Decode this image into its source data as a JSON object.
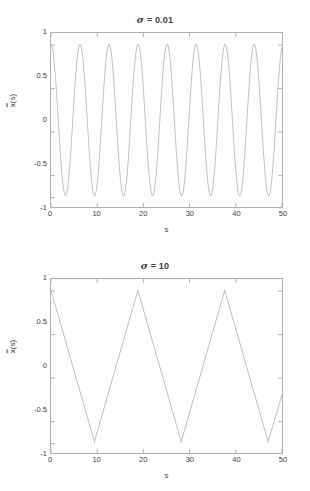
{
  "figure": {
    "background_color": "#ffffff",
    "axis_color": "#a8b0b8",
    "line_color": "#b8c2cc",
    "text_color": "#3d3d3d"
  },
  "chart_data": [
    {
      "type": "line",
      "title": "σ = 0.01",
      "title_symbol": "σ",
      "title_value": "= 0.01",
      "xlabel": "s",
      "ylabel": "x̄(s)",
      "ylabel_base": "x",
      "ylabel_suffix": "(s)",
      "xlim": [
        0,
        50
      ],
      "ylim": [
        -1.15,
        1.15
      ],
      "xticks": [
        0,
        10,
        20,
        30,
        40,
        50
      ],
      "xticklabels": [
        "0",
        "10",
        "20",
        "30",
        "40",
        "50"
      ],
      "yticks": [
        1,
        0.5,
        0,
        -0.5,
        -1
      ],
      "yticklabels": [
        "1",
        "0.5",
        "0",
        "-0.5",
        "-1"
      ],
      "grid": false,
      "legend": null,
      "waveform": "cosine",
      "amplitude": 1,
      "period": 6.283,
      "phase": 0,
      "description": "Smooth sinusoidal oscillation, about 8 full cycles across s = 0 to 50, starting at +1."
    },
    {
      "type": "line",
      "title": "σ = 10",
      "title_symbol": "σ",
      "title_value": "= 10",
      "xlabel": "s",
      "ylabel": "x̄(s)",
      "ylabel_base": "x",
      "ylabel_suffix": "(s)",
      "xlim": [
        0,
        50
      ],
      "ylim": [
        -1.15,
        1.15
      ],
      "xticks": [
        0,
        10,
        20,
        30,
        40,
        50
      ],
      "xticklabels": [
        "0",
        "10",
        "20",
        "30",
        "40",
        "50"
      ],
      "yticks": [
        1,
        0.5,
        0,
        -0.5,
        -1
      ],
      "yticklabels": [
        "1",
        "0.5",
        "0",
        "-0.5",
        "-1"
      ],
      "grid": false,
      "legend": null,
      "waveform": "triangle",
      "amplitude": 1,
      "period": 18.8,
      "phase": 0,
      "vertices": [
        {
          "s": 0,
          "x": 1
        },
        {
          "s": 9.4,
          "x": -1
        },
        {
          "s": 18.8,
          "x": 1
        },
        {
          "s": 28.2,
          "x": -1
        },
        {
          "s": 37.6,
          "x": 1
        },
        {
          "s": 47.0,
          "x": -1
        },
        {
          "s": 50.0,
          "x": -0.38
        }
      ],
      "description": "Triangular wave, amplitude 1, period about 18.8, starting at +1 and descending."
    }
  ]
}
